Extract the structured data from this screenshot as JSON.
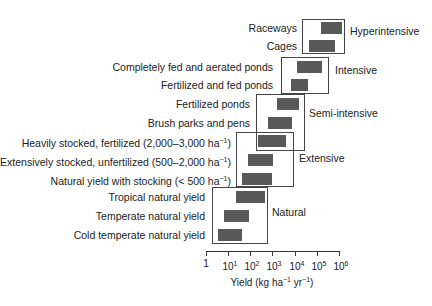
{
  "chart_data": {
    "type": "bar",
    "subtype": "horizontal floating range bars, log x-axis",
    "title": "",
    "xlabel": "Yield (kg ha-1 yr-1)",
    "ylabel": "",
    "xscale": "log",
    "xlim": [
      1,
      1000000
    ],
    "x_ticks": [
      "1",
      "10^1",
      "10^2",
      "10^3",
      "10^4",
      "10^5",
      "10^6"
    ],
    "grid": false,
    "groups": [
      {
        "name": "Hyperintensive",
        "rows": [
          "Raceways",
          "Cages"
        ]
      },
      {
        "name": "Intensive",
        "rows": [
          "Completely fed and aerated ponds",
          "Fertilized and fed ponds"
        ]
      },
      {
        "name": "Semi-intensive",
        "rows": [
          "Fertilized ponds",
          "Brush parks and pens"
        ]
      },
      {
        "name": "Extensive",
        "rows": [
          "Heavily stocked, fertilized (2,000–3,000 ha-1)",
          "Extensively stocked, unfertilized (500–2,000 ha-1)",
          "Natural yield with stocking (< 500 ha-1)"
        ]
      },
      {
        "name": "Natural",
        "rows": [
          "Tropical natural yield",
          "Temperate natural yield",
          "Cold temperate natural yield"
        ]
      }
    ],
    "categories": [
      "Raceways",
      "Cages",
      "Completely fed and aerated ponds",
      "Fertilized and fed ponds",
      "Fertilized ponds",
      "Brush parks and pens",
      "Heavily stocked, fertilized (2,000–3,000 ha-1)",
      "Extensively stocked, unfertilized (500–2,000 ha-1)",
      "Natural yield with stocking (< 500 ha-1)",
      "Tropical natural yield",
      "Temperate natural yield",
      "Cold temperate natural yield"
    ],
    "ranges": [
      [
        150000,
        1300000
      ],
      [
        44000,
        650000
      ],
      [
        12600,
        170000
      ],
      [
        6700,
        39000
      ],
      [
        1600,
        15500
      ],
      [
        620,
        7500
      ],
      [
        220,
        4000
      ],
      [
        78,
        1050
      ],
      [
        42,
        940
      ],
      [
        22,
        450
      ],
      [
        6.5,
        87
      ],
      [
        3.5,
        42
      ]
    ],
    "bar_color": "#595959"
  },
  "rows": [
    {
      "label": "Raceways",
      "y": 28,
      "x0": 321,
      "x1": 342,
      "label_right": 297
    },
    {
      "label": "Cages",
      "y": 46,
      "x0": 309,
      "x1": 335,
      "label_right": 297
    },
    {
      "label": "Completely fed and aerated ponds",
      "y": 67,
      "x0": 297,
      "x1": 322,
      "label_right": 273
    },
    {
      "label": "Fertilized and fed ponds",
      "y": 85,
      "x0": 291,
      "x1": 308,
      "label_right": 273
    },
    {
      "label": "Fertilized ponds",
      "y": 104,
      "x0": 277,
      "x1": 299,
      "label_right": 250
    },
    {
      "label": "Brush parks and pens",
      "y": 123,
      "x0": 268,
      "x1": 292,
      "label_right": 250
    },
    {
      "label": "Heavily stocked, fertilized (2,000–3,000 ha",
      "sup": "−1",
      "tail": ")",
      "y": 141,
      "x0": 258,
      "x1": 286,
      "label_right": 231
    },
    {
      "label": "Extensively stocked, unfertilized (500–2,000 ha",
      "sup": "−1",
      "tail": ")",
      "y": 160,
      "x0": 248,
      "x1": 273,
      "label_right": 231
    },
    {
      "label": "Natural yield with stocking (< 500 ha",
      "sup": "−1",
      "tail": ")",
      "y": 179,
      "x0": 242,
      "x1": 272,
      "label_right": 231
    },
    {
      "label": "Tropical natural yield",
      "y": 197,
      "x0": 236,
      "x1": 265,
      "label_right": 205
    },
    {
      "label": "Temperate natural yield",
      "y": 216,
      "x0": 224,
      "x1": 249,
      "label_right": 205
    },
    {
      "label": "Cold temperate natural yield",
      "y": 235,
      "x0": 218,
      "x1": 242,
      "label_right": 205
    }
  ],
  "groups": [
    {
      "label": "Hyperintensive",
      "box": [
        302,
        19,
        345,
        54
      ],
      "label_x": 350,
      "label_y": 31
    },
    {
      "label": "Intensive",
      "box": [
        281,
        57,
        329,
        94
      ],
      "label_x": 335,
      "label_y": 70
    },
    {
      "label": "Semi-intensive",
      "box": [
        256,
        94,
        305,
        151
      ],
      "label_x": 309,
      "label_y": 113
    },
    {
      "label": "Extensive",
      "box": [
        236,
        132,
        294,
        187
      ],
      "label_x": 299,
      "label_y": 158
    },
    {
      "label": "Natural",
      "box": [
        212,
        187,
        268,
        244
      ],
      "label_x": 272,
      "label_y": 212
    }
  ],
  "axis": {
    "x0": 206,
    "x1": 340,
    "y": 251,
    "ticks": [
      {
        "x": 206,
        "base": "1",
        "exp": ""
      },
      {
        "x": 228,
        "base": "10",
        "exp": "1"
      },
      {
        "x": 250,
        "base": "10",
        "exp": "2"
      },
      {
        "x": 272,
        "base": "10",
        "exp": "3"
      },
      {
        "x": 295,
        "base": "10",
        "exp": "4"
      },
      {
        "x": 317,
        "base": "10",
        "exp": "5"
      },
      {
        "x": 339,
        "base": "10",
        "exp": "6"
      }
    ],
    "xlabel_parts": [
      "Yield (kg ha",
      "−1",
      " yr",
      "−1",
      ")"
    ],
    "xlabel_x": 272,
    "xlabel_y": 274
  }
}
